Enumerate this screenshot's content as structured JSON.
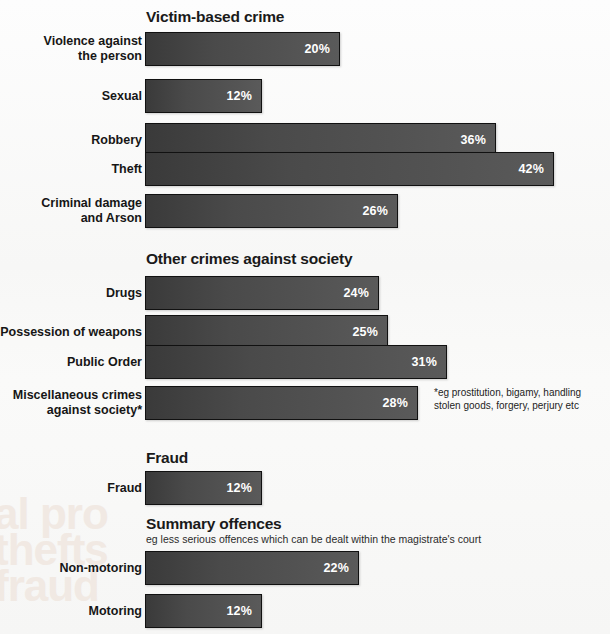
{
  "chart_data": {
    "type": "bar",
    "orientation": "horizontal",
    "title": "",
    "xlabel": "",
    "ylabel": "",
    "xlim": [
      0,
      46
    ],
    "grid": false,
    "legend": null,
    "value_suffix": "%",
    "categories": [
      "Violence against\nthe person",
      "Sexual",
      "Robbery",
      "Theft",
      "Criminal damage\nand Arson",
      "Drugs",
      "Possession of weapons",
      "Public Order",
      "Miscellaneous crimes\nagainst society*",
      "Fraud",
      "Non-motoring",
      "Motoring"
    ],
    "values": [
      20,
      12,
      36,
      42,
      26,
      24,
      25,
      31,
      28,
      12,
      22,
      12
    ],
    "groups": [
      {
        "heading": "Victim-based crime",
        "subtitle": "",
        "categories": [
          "Violence against\nthe person",
          "Sexual",
          "Robbery",
          "Theft",
          "Criminal damage\nand Arson"
        ],
        "values": [
          20,
          12,
          36,
          42,
          26
        ]
      },
      {
        "heading": "Other crimes against society",
        "subtitle": "",
        "categories": [
          "Drugs",
          "Possession of weapons",
          "Public Order",
          "Miscellaneous crimes\nagainst society*"
        ],
        "values": [
          24,
          25,
          31,
          28
        ]
      },
      {
        "heading": "Fraud",
        "subtitle": "",
        "categories": [
          "Fraud"
        ],
        "values": [
          12
        ]
      },
      {
        "heading": "Summary offences",
        "subtitle": "eg less serious offences which can be dealt within the magistrate's court",
        "categories": [
          "Non-motoring",
          "Motoring"
        ],
        "values": [
          22,
          12
        ]
      }
    ],
    "annotations": [
      "*eg prostitution, bigamy, handling\nstolen goods, forgery, perjury etc"
    ]
  },
  "sections": {
    "victim": {
      "heading": "Victim-based crime",
      "rows": [
        {
          "label": "Violence against\nthe person",
          "value": 20,
          "value_label": "20%"
        },
        {
          "label": "Sexual",
          "value": 12,
          "value_label": "12%"
        },
        {
          "label": "Robbery",
          "value": 36,
          "value_label": "36%"
        },
        {
          "label": "Theft",
          "value": 42,
          "value_label": "42%"
        },
        {
          "label": "Criminal damage\nand Arson",
          "value": 26,
          "value_label": "26%"
        }
      ]
    },
    "society": {
      "heading": "Other crimes against society",
      "rows": [
        {
          "label": "Drugs",
          "value": 24,
          "value_label": "24%"
        },
        {
          "label": "Possession of weapons",
          "value": 25,
          "value_label": "25%"
        },
        {
          "label": "Public Order",
          "value": 31,
          "value_label": "31%"
        },
        {
          "label": "Miscellaneous crimes\nagainst society*",
          "value": 28,
          "value_label": "28%"
        }
      ],
      "footnote": "*eg prostitution, bigamy, handling\nstolen goods, forgery, perjury etc"
    },
    "fraud": {
      "heading": "Fraud",
      "rows": [
        {
          "label": "Fraud",
          "value": 12,
          "value_label": "12%"
        }
      ]
    },
    "summary": {
      "heading": "Summary offences",
      "subtitle": "eg less serious offences which can be dealt within the magistrate's court",
      "rows": [
        {
          "label": "Non-motoring",
          "value": 22,
          "value_label": "22%"
        },
        {
          "label": "Motoring",
          "value": 12,
          "value_label": "12%"
        }
      ]
    }
  },
  "watermark": {
    "text": "al pro\nthefts\nfraud"
  },
  "colors": {
    "background": "#fafafa",
    "bar_dark": "#3a3a3a",
    "bar_light": "#5a5a5a",
    "bar_border": "#111111",
    "value_text": "#ffffff",
    "label_text": "#161616",
    "heading_text": "#1a1a1a"
  }
}
